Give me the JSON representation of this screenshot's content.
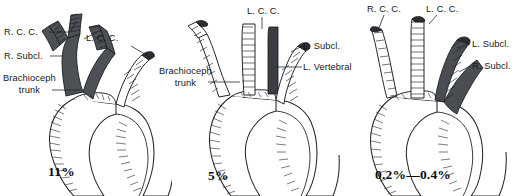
{
  "figure": {
    "background_color": "#ffffff",
    "ink_color": "#1b1e22",
    "shade_color": "#4a4d52",
    "type": "anatomical-illustration"
  },
  "panels": [
    {
      "id": "panel-left",
      "name": "common-origin-variant",
      "percentage": "11%",
      "labels": [
        {
          "name": "label-right-common-carotid",
          "text": "R. C. C.",
          "x": 4,
          "y": 27,
          "align": "left"
        },
        {
          "name": "label-right-subclavian",
          "text": "R. Subcl.",
          "x": 4,
          "y": 51,
          "align": "left"
        },
        {
          "name": "label-brachiocephalic-trunk",
          "text": "Brachioceph\ntrunk",
          "x": 3,
          "y": 73,
          "align": "left"
        },
        {
          "name": "label-left-common-carotid",
          "text": "L. C. C.",
          "x": 86,
          "y": 33,
          "align": "left"
        },
        {
          "name": "label-left-subclavian",
          "text": "L. Subcl.",
          "x": 132,
          "y": 42,
          "align": "left"
        }
      ],
      "shaded_vessels": [
        "brachiocephalic trunk",
        "right common carotid",
        "right subclavian",
        "left common carotid"
      ]
    },
    {
      "id": "panel-middle",
      "name": "left-vertebral-from-arch-variant",
      "percentage": "5%",
      "labels": [
        {
          "name": "label-left-common-carotid",
          "text": "L. C. C.",
          "x": 75,
          "y": 6,
          "align": "left"
        },
        {
          "name": "label-brachiocephalic-trunk",
          "text": "Brachioceph\ntrunk",
          "x": -13,
          "y": 66,
          "align": "left"
        },
        {
          "name": "label-left-subclavian",
          "text": "L. Subcl.",
          "x": 131,
          "y": 41,
          "align": "left"
        },
        {
          "name": "label-left-vertebral",
          "text": "L. Vertebral",
          "x": 131,
          "y": 62,
          "align": "left"
        }
      ],
      "shaded_vessels": [
        "left vertebral artery"
      ]
    },
    {
      "id": "panel-right",
      "name": "aberrant-right-subclavian-variant",
      "percentage": "0.2%—0.4%",
      "labels": [
        {
          "name": "label-right-common-carotid",
          "text": "R. C. C.",
          "x": 22,
          "y": 4,
          "align": "left"
        },
        {
          "name": "label-left-common-carotid",
          "text": "L. C. C.",
          "x": 81,
          "y": 4,
          "align": "left"
        },
        {
          "name": "label-left-subclavian",
          "text": "L. Subcl.",
          "x": 127,
          "y": 39,
          "align": "left"
        },
        {
          "name": "label-right-subclavian",
          "text": "R. Subcl.",
          "x": 127,
          "y": 61,
          "align": "left"
        }
      ],
      "shaded_vessels": [
        "left subclavian",
        "aberrant right subclavian"
      ]
    }
  ]
}
